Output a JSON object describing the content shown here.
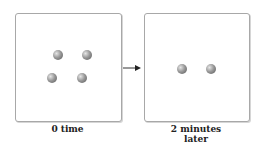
{
  "panels": [
    {
      "caption_lines": [
        "0 time"
      ],
      "balls": [
        {
          "x": 58,
          "y": 55
        },
        {
          "x": 87,
          "y": 55
        },
        {
          "x": 52,
          "y": 78
        },
        {
          "x": 82,
          "y": 78
        }
      ]
    },
    {
      "caption_lines": [
        "2 minutes",
        "later"
      ],
      "balls": [
        {
          "x": 182,
          "y": 69
        },
        {
          "x": 211,
          "y": 69
        }
      ]
    }
  ],
  "arrow": {
    "icon": "right-arrow-icon"
  }
}
